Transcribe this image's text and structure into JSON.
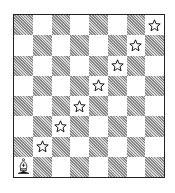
{
  "board": {
    "files": [
      "a",
      "b",
      "c",
      "d",
      "e",
      "f",
      "g",
      "h"
    ],
    "ranks": [
      8,
      7,
      6,
      5,
      4,
      3,
      2,
      1
    ],
    "colors": {
      "light": "#ffffff",
      "dark": "#b5b5b5",
      "border": "#222222"
    },
    "pieces": [
      {
        "square": "a1",
        "piece": "white-bishop"
      }
    ],
    "markers": [
      {
        "square": "b2",
        "type": "star"
      },
      {
        "square": "c3",
        "type": "star"
      },
      {
        "square": "d4",
        "type": "star"
      },
      {
        "square": "e5",
        "type": "star"
      },
      {
        "square": "f6",
        "type": "star"
      },
      {
        "square": "g7",
        "type": "star"
      },
      {
        "square": "h8",
        "type": "star"
      }
    ]
  }
}
